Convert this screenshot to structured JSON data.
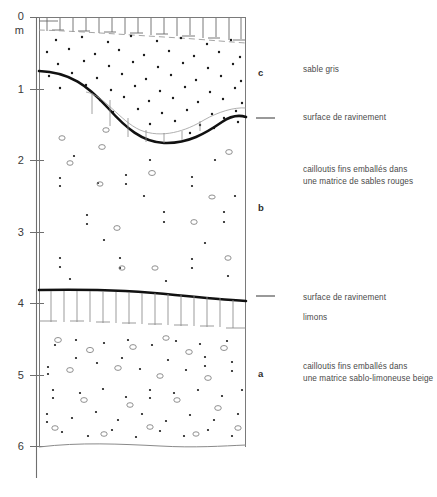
{
  "figure": {
    "type": "stratigraphic-log",
    "language": "fr",
    "axis": {
      "unit_label": "m",
      "orientation": "vertical-depth",
      "ticks": [
        {
          "label": "0",
          "depth_m": 0
        },
        {
          "label": "1",
          "depth_m": 1
        },
        {
          "label": "2",
          "depth_m": 2
        },
        {
          "label": "3",
          "depth_m": 3
        },
        {
          "label": "4",
          "depth_m": 4
        },
        {
          "label": "5",
          "depth_m": 5
        },
        {
          "label": "6",
          "depth_m": 6
        }
      ],
      "range_m": [
        0,
        6
      ]
    },
    "units": [
      {
        "letter": "c",
        "label": "sable gris",
        "top_m": 0.0,
        "base_m": 1.45,
        "pattern": "dense-dots"
      },
      {
        "letter": "b",
        "label": "cailloutis fins emballés dans\nune matrice de sables rouges",
        "top_m": 1.45,
        "base_m": 3.85,
        "pattern": "sparse-dots-and-pebbles"
      },
      {
        "letter": "a",
        "label": "cailloutis fins emballés dans\nune matrice sablo-limoneuse beige",
        "top_m": 4.35,
        "base_m": 6.0,
        "pattern": "dots-and-pebbles"
      }
    ],
    "boundaries": [
      {
        "name": "surface-de-ravinement-superieure",
        "label": "surface de ravinement",
        "depth_m": 1.45,
        "style": "thick-wavy"
      },
      {
        "name": "surface-de-ravinement-inferieure",
        "label": "surface de ravinement",
        "depth_m": 3.85,
        "style": "thick-wavy"
      }
    ],
    "interbeds": [
      {
        "name": "limons",
        "label": "limons",
        "top_m": 3.85,
        "base_m": 4.35,
        "pattern": "vertical-hatch"
      },
      {
        "name": "sol-laboure-sommet",
        "label": "",
        "top_m": 0.0,
        "base_m": 0.25,
        "pattern": "vertical-hatch"
      }
    ],
    "annotations": [
      {
        "id": "ann-sable-gris",
        "text": "sable gris",
        "x": 303,
        "y": 66
      },
      {
        "id": "ann-ravinement-haut",
        "text": "surface de ravinement",
        "x": 303,
        "y": 113
      },
      {
        "id": "ann-cailloutis-rouges",
        "text": "cailloutis fins emballés dans\nune matrice de sables rouges",
        "x": 303,
        "y": 166
      },
      {
        "id": "ann-ravinement-bas",
        "text": "surface de ravinement",
        "x": 303,
        "y": 296
      },
      {
        "id": "ann-limons",
        "text": "limons",
        "x": 303,
        "y": 315
      },
      {
        "id": "ann-cailloutis-beige",
        "text": "cailloutis fins emballés dans\nune matrice sablo-limoneuse beige",
        "x": 303,
        "y": 364
      }
    ],
    "colors": {
      "ink": "#1a1a1a",
      "thin_line": "#8a8a8a",
      "text": "#4a4a4a",
      "background": "#ffffff"
    }
  }
}
